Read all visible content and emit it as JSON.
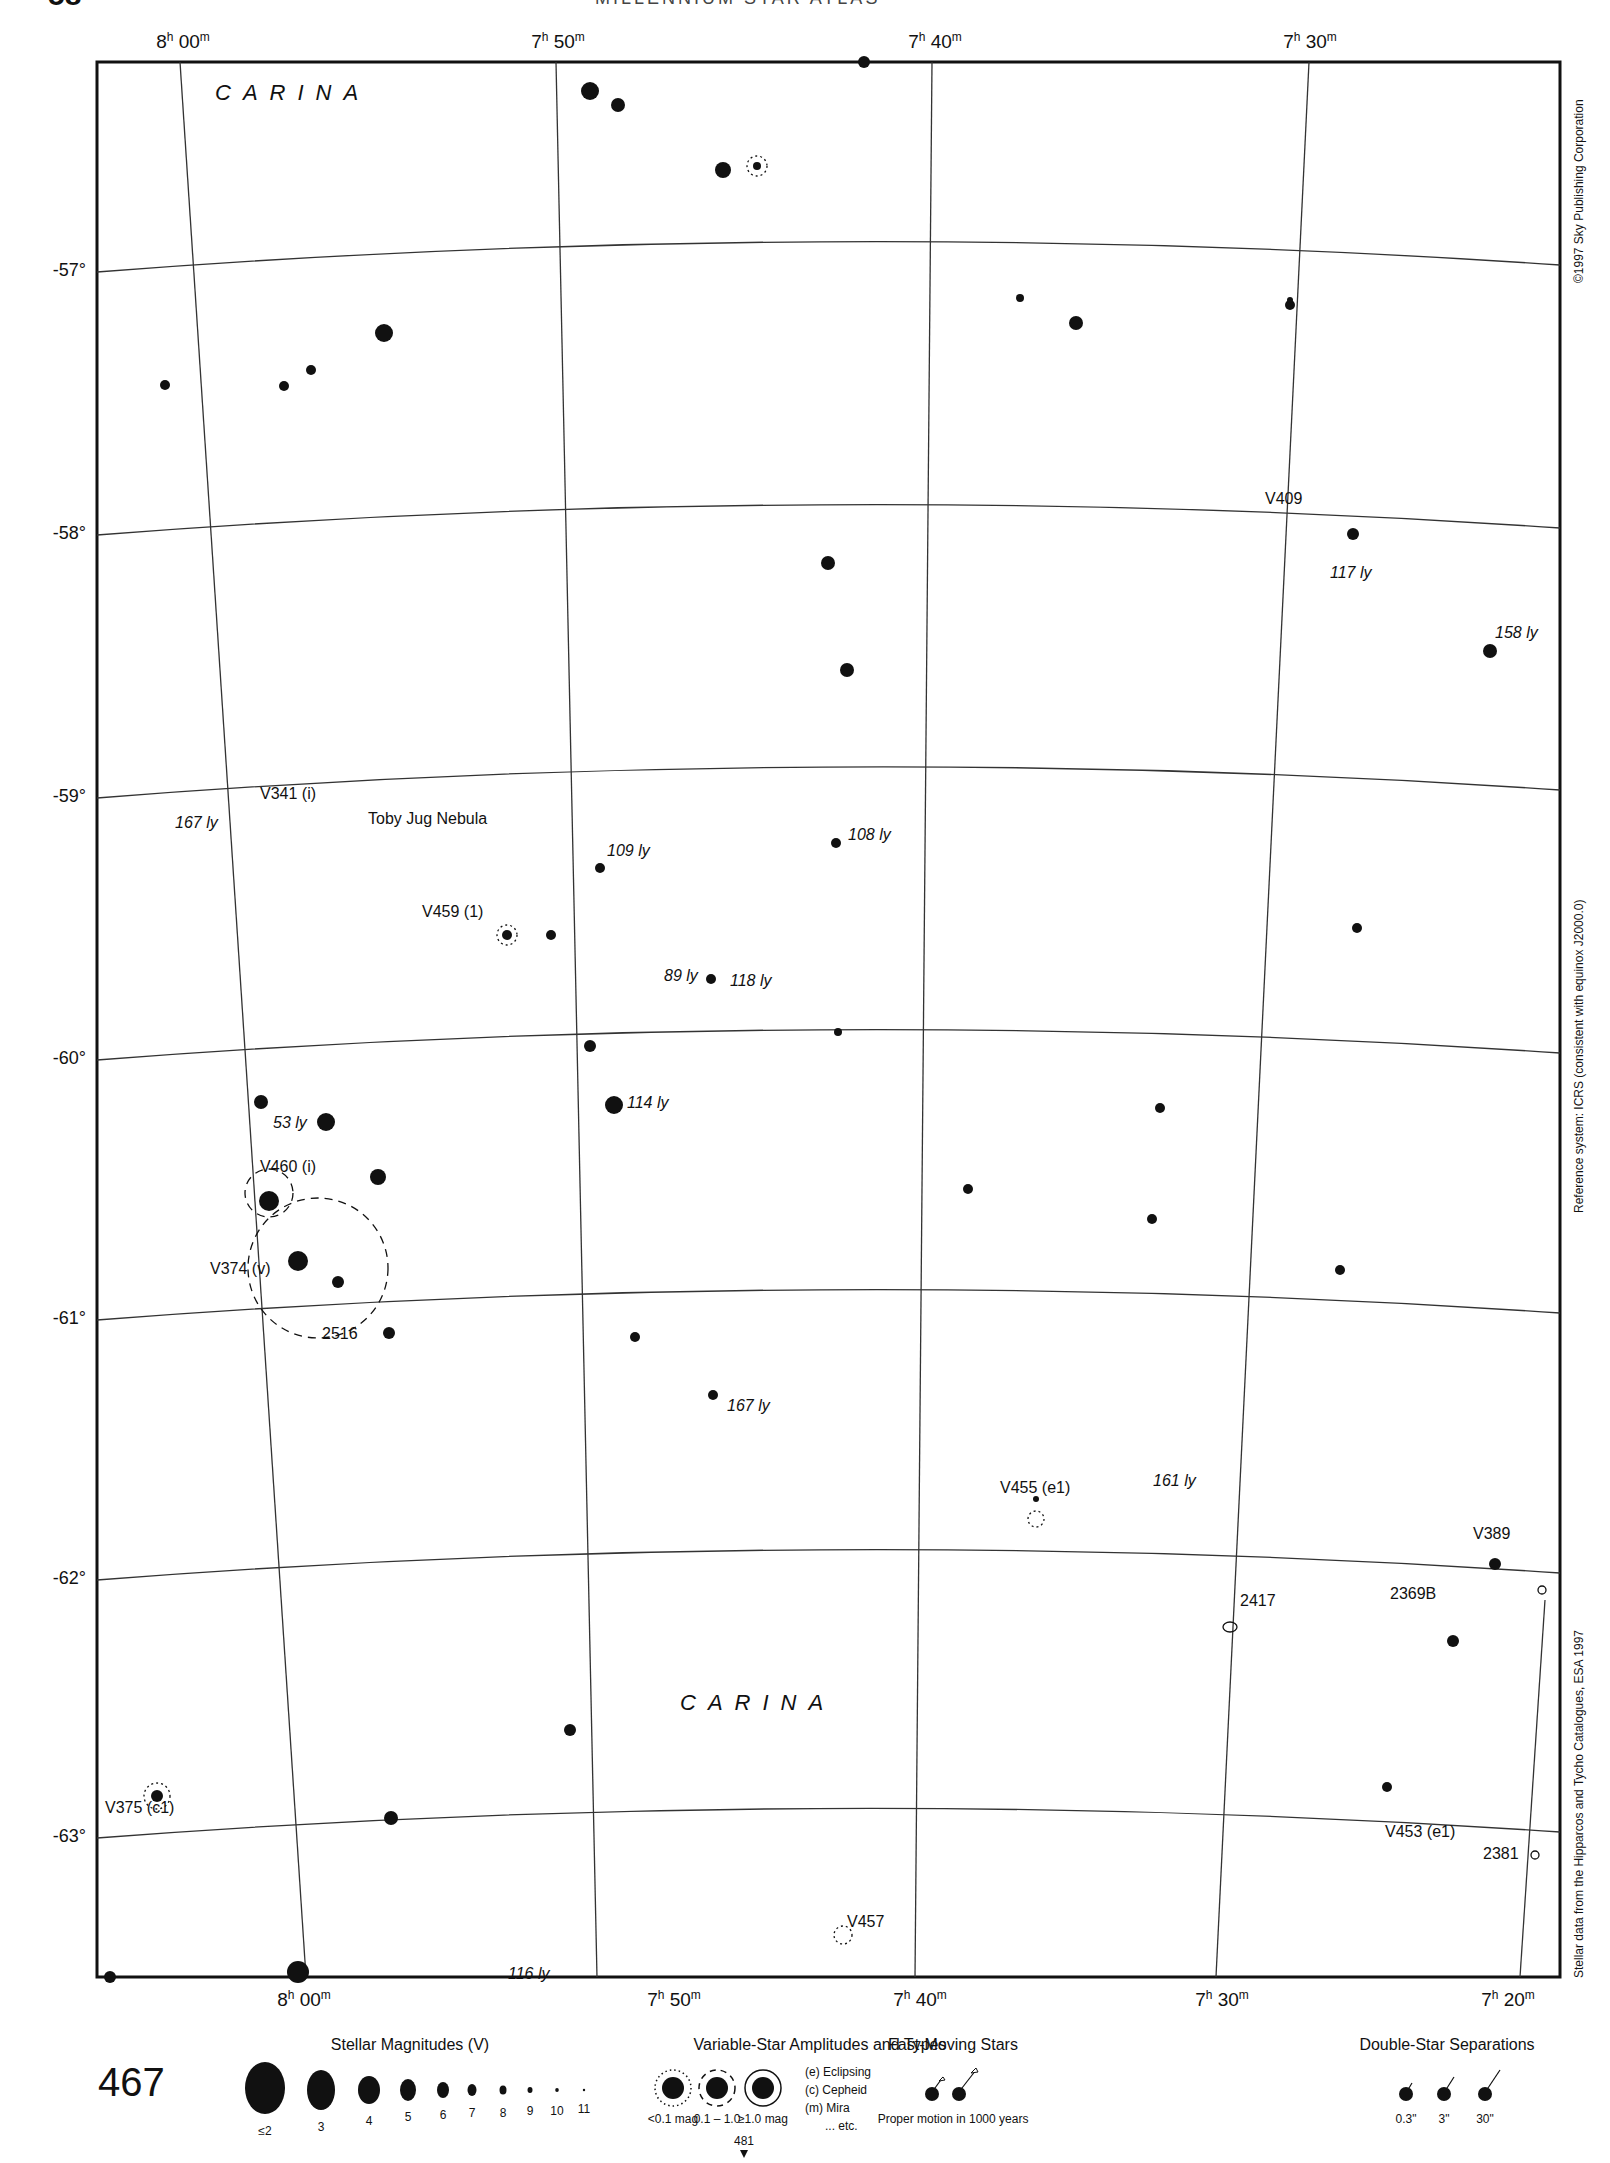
{
  "header": {
    "page_number_partial": "58",
    "atlas_title_partial": "MILLENNIUM STAR ATLAS"
  },
  "map": {
    "constellation_labels": [
      {
        "text": "CARINA",
        "x": 215,
        "y": 80
      },
      {
        "text": "CARINA",
        "x": 680,
        "y": 1690
      }
    ],
    "ra_top": [
      {
        "label_h": "8",
        "label_m": "00",
        "x": 183
      },
      {
        "label_h": "7",
        "label_m": "50",
        "x": 558
      },
      {
        "label_h": "7",
        "label_m": "40",
        "x": 935
      },
      {
        "label_h": "7",
        "label_m": "30",
        "x": 1310
      }
    ],
    "ra_bottom": [
      {
        "label_h": "8",
        "label_m": "00",
        "x": 304
      },
      {
        "label_h": "7",
        "label_m": "50",
        "x": 674
      },
      {
        "label_h": "7",
        "label_m": "40",
        "x": 920
      },
      {
        "label_h": "7",
        "label_m": "30",
        "x": 1222
      },
      {
        "label_h": "7",
        "label_m": "20",
        "x": 1508
      }
    ],
    "declinations": [
      {
        "label": "-57°",
        "y": 272
      },
      {
        "label": "-58°",
        "y": 535
      },
      {
        "label": "-59°",
        "y": 798
      },
      {
        "label": "-60°",
        "y": 1060
      },
      {
        "label": "-61°",
        "y": 1320
      },
      {
        "label": "-62°",
        "y": 1580
      },
      {
        "label": "-63°",
        "y": 1838
      }
    ],
    "object_labels": [
      {
        "text": "V409",
        "x": 1265,
        "y": 498,
        "italic": false
      },
      {
        "text": "117 ly",
        "x": 1330,
        "y": 572,
        "italic": true
      },
      {
        "text": "158 ly",
        "x": 1495,
        "y": 632,
        "italic": true
      },
      {
        "text": "V341 (i)",
        "x": 260,
        "y": 793,
        "italic": false
      },
      {
        "text": "Toby Jug Nebula",
        "x": 368,
        "y": 818,
        "italic": false
      },
      {
        "text": "167 ly",
        "x": 175,
        "y": 822,
        "italic": true
      },
      {
        "text": "109 ly",
        "x": 607,
        "y": 850,
        "italic": true
      },
      {
        "text": "108 ly",
        "x": 848,
        "y": 834,
        "italic": true
      },
      {
        "text": "V459 (1)",
        "x": 422,
        "y": 911,
        "italic": false
      },
      {
        "text": "89 ly",
        "x": 664,
        "y": 975,
        "italic": true
      },
      {
        "text": "118 ly",
        "x": 730,
        "y": 980,
        "italic": true
      },
      {
        "text": "53 ly",
        "x": 273,
        "y": 1122,
        "italic": true
      },
      {
        "text": "114 ly",
        "x": 627,
        "y": 1102,
        "italic": true
      },
      {
        "text": "V460 (i)",
        "x": 260,
        "y": 1166,
        "italic": false
      },
      {
        "text": "V374 (v)",
        "x": 210,
        "y": 1268,
        "italic": false
      },
      {
        "text": "2516",
        "x": 322,
        "y": 1333,
        "italic": false
      },
      {
        "text": "167 ly",
        "x": 727,
        "y": 1405,
        "italic": true
      },
      {
        "text": "V455 (e1)",
        "x": 1000,
        "y": 1487,
        "italic": false
      },
      {
        "text": "161 ly",
        "x": 1153,
        "y": 1480,
        "italic": true
      },
      {
        "text": "V389",
        "x": 1473,
        "y": 1533,
        "italic": false
      },
      {
        "text": "2417",
        "x": 1240,
        "y": 1600,
        "italic": false
      },
      {
        "text": "2369B",
        "x": 1390,
        "y": 1593,
        "italic": false
      },
      {
        "text": "V375 (c1)",
        "x": 105,
        "y": 1807,
        "italic": false
      },
      {
        "text": "V453 (e1)",
        "x": 1385,
        "y": 1831,
        "italic": false
      },
      {
        "text": "2381",
        "x": 1483,
        "y": 1853,
        "italic": false
      },
      {
        "text": "V457",
        "x": 847,
        "y": 1921,
        "italic": false
      },
      {
        "text": "116 ly",
        "x": 508,
        "y": 1973,
        "italic": true
      }
    ],
    "side_texts": {
      "copyright": "©1997 Sky Publishing Corporation",
      "reference": "Reference system: ICRS (consistent with equinox J2000.0)",
      "source": "Stellar data from the Hipparcos and Tycho Catalogues, ESA 1997"
    }
  },
  "legend": {
    "chart_number": "467",
    "magnitudes": {
      "title": "Stellar Magnitudes (V)",
      "items": [
        "≤2",
        "3",
        "4",
        "5",
        "6",
        "7",
        "8",
        "9",
        "10",
        "11"
      ]
    },
    "variables": {
      "title": "Variable-Star Amplitudes and Types",
      "items": [
        "<0.1 mag",
        "0.1 – 1.0",
        "≥1.0 mag"
      ],
      "types": [
        "(e)  Eclipsing",
        "(c)  Cepheid",
        "(m)  Mira",
        "... etc."
      ]
    },
    "fast_moving": {
      "title": "Fast-Moving Stars",
      "caption": "Proper motion in 1000 years"
    },
    "doubles": {
      "title": "Double-Star Separations",
      "items": [
        "0.3\"",
        "3\"",
        "30\""
      ]
    },
    "adjacent_chart": "481"
  }
}
